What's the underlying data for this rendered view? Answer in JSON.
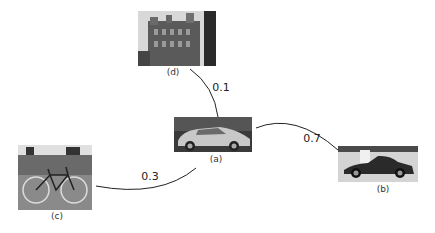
{
  "nodes": [
    {
      "id": "a",
      "label": "(a)",
      "subject": "silver sedan car"
    },
    {
      "id": "b",
      "label": "(b)",
      "subject": "dark sports car"
    },
    {
      "id": "c",
      "label": "(c)",
      "subject": "bicycle"
    },
    {
      "id": "d",
      "label": "(d)",
      "subject": "building"
    }
  ],
  "edges": [
    {
      "from": "a",
      "to": "d",
      "weight": "0.1"
    },
    {
      "from": "a",
      "to": "b",
      "weight": "0.7"
    },
    {
      "from": "a",
      "to": "c",
      "weight": "0.3"
    }
  ],
  "colors": {
    "edge": "#222222",
    "text": "#333333"
  }
}
